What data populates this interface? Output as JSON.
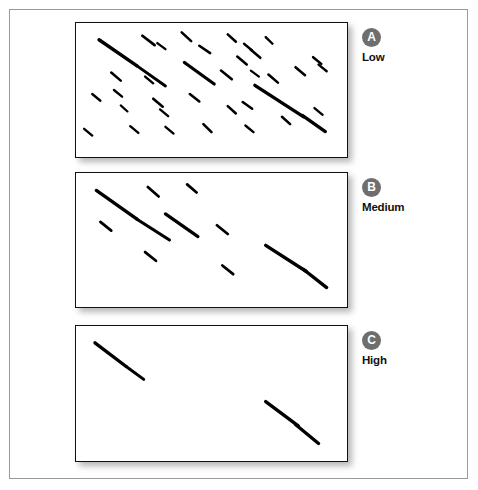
{
  "figure": {
    "width": 478,
    "height": 490,
    "background_color": "#ffffff",
    "frame_color": "#9a9a9a",
    "mark_color": "#000000",
    "badge_color": "#6e6e6e",
    "badge_text_color": "#ffffff",
    "panel_border_color": "#111111",
    "shadow_color": "#9d9d9d"
  },
  "panels": [
    {
      "id": "A",
      "badge": "A",
      "label": "Low",
      "rect": {
        "x": 75,
        "y": 22,
        "w": 273,
        "h": 136
      },
      "description": "Low clustering: many short isolated diagonal dashes scattered across the field, with two longer segmented streaks.",
      "mark_count": 32
    },
    {
      "id": "B",
      "badge": "B",
      "label": "Medium",
      "rect": {
        "x": 75,
        "y": 172,
        "w": 273,
        "h": 136
      },
      "description": "Medium clustering: fewer, longer segmented diagonal streaks.",
      "mark_count": 9
    },
    {
      "id": "C",
      "badge": "C",
      "label": "High",
      "rect": {
        "x": 75,
        "y": 325,
        "w": 273,
        "h": 137
      },
      "description": "High clustering: only two long segmented diagonal streaks remain.",
      "mark_count": 2
    }
  ],
  "labels": [
    {
      "badge": "A",
      "text": "Low",
      "x": 362,
      "y": 28
    },
    {
      "badge": "B",
      "text": "Medium",
      "x": 362,
      "y": 178
    },
    {
      "badge": "C",
      "text": "High",
      "x": 362,
      "y": 331
    }
  ],
  "chart_data": {
    "type": "scatter",
    "title": "",
    "xlabel": "",
    "ylabel": "",
    "grid": false,
    "legend": "none",
    "note": "Three stacked panels of diagonal dash marks oriented down-right at about 45 degrees. Mark coordinates are normalized 0-1 within each panel: x0,y0 = start, x1,y1 = end, w = stroke width in panel-normalized units of the 273x136 panel.",
    "series": [
      {
        "name": "A (Low)",
        "panel": "A",
        "marks": [
          {
            "x0": 0.085,
            "y0": 0.125,
            "x1": 0.225,
            "y1": 0.32,
            "w": 3.4
          },
          {
            "x0": 0.225,
            "y0": 0.32,
            "x1": 0.33,
            "y1": 0.47,
            "w": 3.0
          },
          {
            "x0": 0.245,
            "y0": 0.095,
            "x1": 0.29,
            "y1": 0.165,
            "w": 2.8
          },
          {
            "x0": 0.3,
            "y0": 0.15,
            "x1": 0.33,
            "y1": 0.195,
            "w": 2.4
          },
          {
            "x0": 0.39,
            "y0": 0.07,
            "x1": 0.425,
            "y1": 0.135,
            "w": 2.6
          },
          {
            "x0": 0.455,
            "y0": 0.17,
            "x1": 0.495,
            "y1": 0.225,
            "w": 2.6
          },
          {
            "x0": 0.56,
            "y0": 0.085,
            "x1": 0.59,
            "y1": 0.14,
            "w": 2.6
          },
          {
            "x0": 0.62,
            "y0": 0.155,
            "x1": 0.65,
            "y1": 0.205,
            "w": 2.4
          },
          {
            "x0": 0.645,
            "y0": 0.2,
            "x1": 0.68,
            "y1": 0.26,
            "w": 2.6
          },
          {
            "x0": 0.7,
            "y0": 0.105,
            "x1": 0.725,
            "y1": 0.155,
            "w": 2.4
          },
          {
            "x0": 0.13,
            "y0": 0.37,
            "x1": 0.165,
            "y1": 0.43,
            "w": 2.6
          },
          {
            "x0": 0.255,
            "y0": 0.4,
            "x1": 0.285,
            "y1": 0.45,
            "w": 2.4
          },
          {
            "x0": 0.4,
            "y0": 0.295,
            "x1": 0.51,
            "y1": 0.455,
            "w": 3.2
          },
          {
            "x0": 0.535,
            "y0": 0.355,
            "x1": 0.575,
            "y1": 0.42,
            "w": 2.6
          },
          {
            "x0": 0.595,
            "y0": 0.25,
            "x1": 0.63,
            "y1": 0.31,
            "w": 2.6
          },
          {
            "x0": 0.71,
            "y0": 0.385,
            "x1": 0.745,
            "y1": 0.445,
            "w": 2.6
          },
          {
            "x0": 0.645,
            "y0": 0.355,
            "x1": 0.675,
            "y1": 0.4,
            "w": 2.2
          },
          {
            "x0": 0.81,
            "y0": 0.33,
            "x1": 0.845,
            "y1": 0.39,
            "w": 2.6
          },
          {
            "x0": 0.875,
            "y0": 0.255,
            "x1": 0.905,
            "y1": 0.305,
            "w": 2.6
          },
          {
            "x0": 0.895,
            "y0": 0.31,
            "x1": 0.925,
            "y1": 0.36,
            "w": 2.4
          },
          {
            "x0": 0.06,
            "y0": 0.53,
            "x1": 0.09,
            "y1": 0.58,
            "w": 2.4
          },
          {
            "x0": 0.14,
            "y0": 0.5,
            "x1": 0.17,
            "y1": 0.55,
            "w": 2.4
          },
          {
            "x0": 0.165,
            "y0": 0.615,
            "x1": 0.19,
            "y1": 0.66,
            "w": 2.2
          },
          {
            "x0": 0.285,
            "y0": 0.565,
            "x1": 0.32,
            "y1": 0.625,
            "w": 2.6
          },
          {
            "x0": 0.31,
            "y0": 0.645,
            "x1": 0.34,
            "y1": 0.695,
            "w": 2.4
          },
          {
            "x0": 0.42,
            "y0": 0.53,
            "x1": 0.455,
            "y1": 0.585,
            "w": 2.6
          },
          {
            "x0": 0.56,
            "y0": 0.62,
            "x1": 0.59,
            "y1": 0.675,
            "w": 2.6
          },
          {
            "x0": 0.615,
            "y0": 0.59,
            "x1": 0.65,
            "y1": 0.64,
            "w": 2.6
          },
          {
            "x0": 0.66,
            "y0": 0.465,
            "x1": 0.84,
            "y1": 0.7,
            "w": 3.4
          },
          {
            "x0": 0.835,
            "y0": 0.69,
            "x1": 0.92,
            "y1": 0.81,
            "w": 3.4
          },
          {
            "x0": 0.76,
            "y0": 0.7,
            "x1": 0.79,
            "y1": 0.755,
            "w": 2.6
          },
          {
            "x0": 0.88,
            "y0": 0.635,
            "x1": 0.91,
            "y1": 0.685,
            "w": 2.4
          },
          {
            "x0": 0.03,
            "y0": 0.79,
            "x1": 0.06,
            "y1": 0.84,
            "w": 2.4
          },
          {
            "x0": 0.2,
            "y0": 0.77,
            "x1": 0.23,
            "y1": 0.82,
            "w": 2.4
          },
          {
            "x0": 0.33,
            "y0": 0.775,
            "x1": 0.36,
            "y1": 0.825,
            "w": 2.4
          },
          {
            "x0": 0.47,
            "y0": 0.755,
            "x1": 0.5,
            "y1": 0.815,
            "w": 2.6
          },
          {
            "x0": 0.625,
            "y0": 0.765,
            "x1": 0.655,
            "y1": 0.815,
            "w": 2.4
          }
        ]
      },
      {
        "name": "B (Medium)",
        "panel": "B",
        "marks": [
          {
            "x0": 0.075,
            "y0": 0.13,
            "x1": 0.225,
            "y1": 0.345,
            "w": 3.4
          },
          {
            "x0": 0.225,
            "y0": 0.345,
            "x1": 0.345,
            "y1": 0.5,
            "w": 3.2
          },
          {
            "x0": 0.265,
            "y0": 0.105,
            "x1": 0.305,
            "y1": 0.175,
            "w": 2.8
          },
          {
            "x0": 0.41,
            "y0": 0.085,
            "x1": 0.445,
            "y1": 0.145,
            "w": 2.8
          },
          {
            "x0": 0.09,
            "y0": 0.365,
            "x1": 0.13,
            "y1": 0.43,
            "w": 2.8
          },
          {
            "x0": 0.33,
            "y0": 0.305,
            "x1": 0.45,
            "y1": 0.475,
            "w": 3.2
          },
          {
            "x0": 0.52,
            "y0": 0.39,
            "x1": 0.56,
            "y1": 0.455,
            "w": 2.8
          },
          {
            "x0": 0.255,
            "y0": 0.59,
            "x1": 0.295,
            "y1": 0.655,
            "w": 2.8
          },
          {
            "x0": 0.54,
            "y0": 0.69,
            "x1": 0.58,
            "y1": 0.755,
            "w": 2.8
          },
          {
            "x0": 0.7,
            "y0": 0.54,
            "x1": 0.85,
            "y1": 0.735,
            "w": 3.4
          },
          {
            "x0": 0.84,
            "y0": 0.72,
            "x1": 0.925,
            "y1": 0.855,
            "w": 3.4
          }
        ]
      },
      {
        "name": "C (High)",
        "panel": "C",
        "marks": [
          {
            "x0": 0.07,
            "y0": 0.125,
            "x1": 0.185,
            "y1": 0.3,
            "w": 3.4
          },
          {
            "x0": 0.185,
            "y0": 0.3,
            "x1": 0.25,
            "y1": 0.395,
            "w": 3.0
          },
          {
            "x0": 0.7,
            "y0": 0.56,
            "x1": 0.82,
            "y1": 0.74,
            "w": 3.4
          },
          {
            "x0": 0.81,
            "y0": 0.73,
            "x1": 0.895,
            "y1": 0.87,
            "w": 3.4
          }
        ]
      }
    ]
  }
}
